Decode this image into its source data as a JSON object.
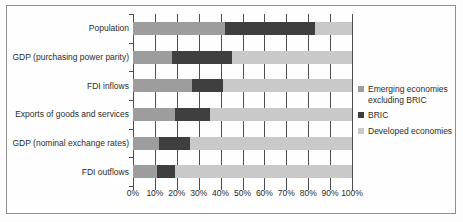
{
  "chart_data": {
    "type": "bar",
    "orientation": "horizontal",
    "stacked": true,
    "title": "",
    "xlabel": "",
    "ylabel": "",
    "xlim": [
      0,
      100
    ],
    "grid": true,
    "legend_position": "right",
    "categories": [
      "Population",
      "GDP (purchasing power parity)",
      "FDI  inflows",
      "Exports of goods and services",
      "GDP (nominal exchange rates)",
      "FDI outflows"
    ],
    "xticks": [
      "0%",
      "10%",
      "20%",
      "30%",
      "40%",
      "50%",
      "60%",
      "70%",
      "80%",
      "90%",
      "100%"
    ],
    "xtick_values": [
      0,
      10,
      20,
      30,
      40,
      50,
      60,
      70,
      80,
      90,
      100
    ],
    "series": [
      {
        "name": "Emerging economies excluding BRIC",
        "color": "#9d9d9d",
        "values": [
          42,
          18,
          27,
          19,
          12,
          11
        ]
      },
      {
        "name": "BRIC",
        "color": "#3f3f3f",
        "values": [
          41,
          27,
          14,
          16,
          14,
          8
        ]
      },
      {
        "name": "Developed economies",
        "color": "#c9c9c9",
        "values": [
          17,
          55,
          59,
          65,
          74,
          81
        ]
      }
    ]
  },
  "legend": {
    "entries": [
      {
        "label": "Emerging economies excluding BRIC",
        "color": "#9d9d9d"
      },
      {
        "label": "BRIC",
        "color": "#3f3f3f"
      },
      {
        "label": "Developed economies",
        "color": "#c9c9c9"
      }
    ]
  },
  "colors": {
    "emerging": "#9d9d9d",
    "bric": "#3f3f3f",
    "developed": "#c9c9c9",
    "frame": "#8e8e8e",
    "gridline": "#4f4f4f",
    "text": "#2b2b2b"
  }
}
